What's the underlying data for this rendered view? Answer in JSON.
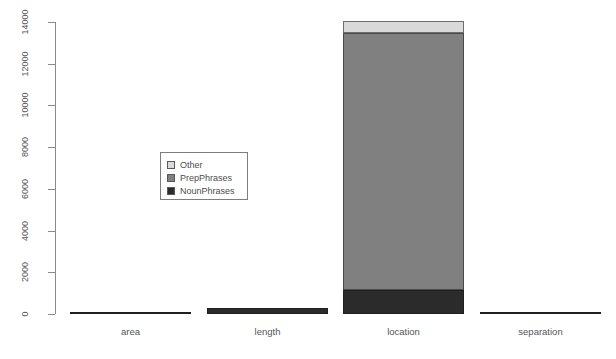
{
  "chart_data": {
    "type": "bar",
    "stacked": true,
    "title": "",
    "subtitle": "",
    "xlabel": "",
    "ylabel": "",
    "categories": [
      "area",
      "length",
      "location",
      "separation"
    ],
    "series": [
      {
        "name": "NounPhrases",
        "color": "#2b2b2b",
        "values": [
          100,
          290,
          1130,
          110
        ]
      },
      {
        "name": "PrepPhrases",
        "color": "#808080",
        "values": [
          0,
          0,
          12320,
          0
        ]
      },
      {
        "name": "Other",
        "color": "#d9d9d9",
        "values": [
          0,
          0,
          600,
          0
        ]
      }
    ],
    "totals": [
      100,
      290,
      14050,
      110
    ],
    "ylim": [
      0,
      14000
    ],
    "yticks": [
      0,
      2000,
      4000,
      6000,
      8000,
      10000,
      12000,
      14000
    ],
    "ytick_labels": [
      "0",
      "2000",
      "4000",
      "6000",
      "8000",
      "10000",
      "12000",
      "14000"
    ],
    "grid": false,
    "legend_position": "center-left",
    "legend_entries": [
      {
        "label": "Other",
        "color": "#d9d9d9"
      },
      {
        "label": "PrepPhrases",
        "color": "#808080"
      },
      {
        "label": "NounPhrases",
        "color": "#2b2b2b"
      }
    ],
    "axis_color": "#8a8a8a",
    "background": "#ffffff"
  }
}
